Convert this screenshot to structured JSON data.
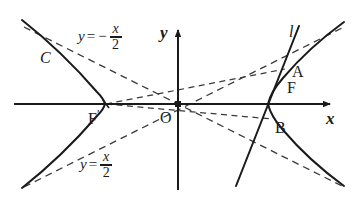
{
  "figure": {
    "type": "geometry-diagram",
    "background_color": "#ffffff",
    "stroke_color": "#1a1a1a",
    "dash_color": "#3a3a3a"
  },
  "axes": {
    "x_label": "x",
    "y_label": "y",
    "origin_label": "O",
    "x_axis": {
      "x1": 14,
      "y1": 104,
      "x2": 334,
      "y2": 104
    },
    "y_axis": {
      "x1": 178,
      "y1": 190,
      "x2": 178,
      "y2": 24
    }
  },
  "labels": {
    "curve_c": "C",
    "line_l": "l",
    "focus_left": "F",
    "focus_left_prime": "′",
    "focus_right": "F",
    "point_a": "A",
    "point_b": "B"
  },
  "equations": {
    "asymptote_upper": {
      "lhs": "y",
      "eq": "=",
      "sign": "−",
      "numerator": "x",
      "denominator": "2",
      "text": "y = -x/2"
    },
    "asymptote_lower": {
      "lhs": "y",
      "eq": "=",
      "sign": "",
      "numerator": "x",
      "denominator": "2",
      "text": "y = x/2"
    }
  },
  "geometry": {
    "hyperbola": {
      "semi_axis_a_px": 73,
      "semi_axis_b_px": 36.5,
      "asymptote_slope": 0.5,
      "center_px": {
        "x": 178,
        "y": 104
      },
      "left_vertex_px": {
        "x": 105,
        "y": 104
      },
      "right_vertex_px": {
        "x": 268,
        "y": 104
      }
    },
    "focus_left_px": {
      "x": 106,
      "y": 104
    },
    "focus_right_px": {
      "x": 277,
      "y": 104
    },
    "point_a_px": {
      "x": 285,
      "y": 69
    },
    "point_b_px": {
      "x": 272,
      "y": 119
    },
    "line_l_px": {
      "x1": 236,
      "y1": 186,
      "x2": 300,
      "y2": 26
    }
  }
}
